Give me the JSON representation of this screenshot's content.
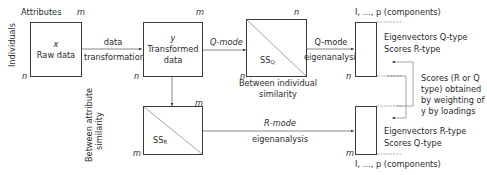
{
  "raw_data": {
    "header": "Attributes",
    "cols": "m",
    "rows": "n",
    "row_axis": "Individuals",
    "symbol": "x",
    "label": "Raw data"
  },
  "transform_arrow": {
    "line1": "data",
    "line2": "transformation"
  },
  "transformed": {
    "cols": "m",
    "rows": "n",
    "symbol": "y",
    "line1": "Transformed",
    "line2": "data"
  },
  "q_mode_arrow": {
    "label": "Q-mode"
  },
  "ss_q": {
    "cols": "n",
    "rows": "n",
    "label_main": "SS",
    "label_sub": "Q",
    "caption1": "Between individual",
    "caption2": "similarity"
  },
  "q_eig_arrow": {
    "line1": "Q-mode",
    "line2": "eigenanalysis"
  },
  "q_result": {
    "components": "I, …, p (components)",
    "rows": "n",
    "line1": "Eigenvectors Q-type",
    "line2": "Scores R-type"
  },
  "scores_note": {
    "lines": [
      "Scores (R or Q",
      "type) obtained",
      "by weighting of",
      "y by loadings"
    ]
  },
  "ss_r": {
    "cols": "m",
    "rows": "m",
    "label_main": "SS",
    "label_sub": "R",
    "caption1": "Between attribute",
    "caption2": "similarity"
  },
  "r_eig_arrow": {
    "line1": "R-mode",
    "line2": "eigenanalysis"
  },
  "r_result": {
    "rows": "m",
    "components": "I, …, p (components)",
    "line1": "Eigenvectors R-type",
    "line2": "Scores Q-type"
  },
  "colors": {
    "stroke": "#3a3a3a",
    "text": "#2a2a2a"
  }
}
